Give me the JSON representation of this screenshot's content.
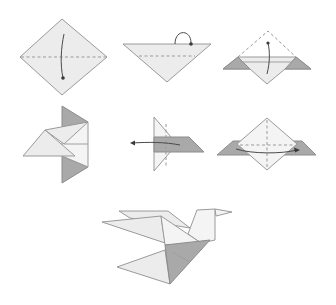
{
  "diagram": {
    "colors": {
      "paper_fill": "#ececec",
      "paper_light": "#f4f4f4",
      "shaded_side": "#a9a9a9",
      "outline": "#9a9a9a",
      "arrow": "#4a4a4a"
    },
    "steps": [
      {
        "id": 1,
        "name": "square-diamond",
        "instruction": "Fold top corner down to bottom along horizontal dashed line (valley fold)"
      },
      {
        "id": 2,
        "name": "triangle",
        "instruction": "Fold layer along dashed line; flip-over arrow at top edge"
      },
      {
        "id": 3,
        "name": "triangle-with-flaps",
        "instruction": "Fold bottom point up to top along crease; dashed outline shows previous position"
      },
      {
        "id": 4,
        "name": "side-flaps",
        "instruction": "Shaded back flaps shown top and bottom; fold result"
      },
      {
        "id": 5,
        "name": "fold-left",
        "instruction": "Fold layer to the left along vertical dashed line"
      },
      {
        "id": 6,
        "name": "fold-across",
        "instruction": "Fold along horizontal dashed line; curved arrow across to the right"
      },
      {
        "id": 7,
        "name": "finished-dove",
        "instruction": "Completed origami dove"
      }
    ]
  }
}
